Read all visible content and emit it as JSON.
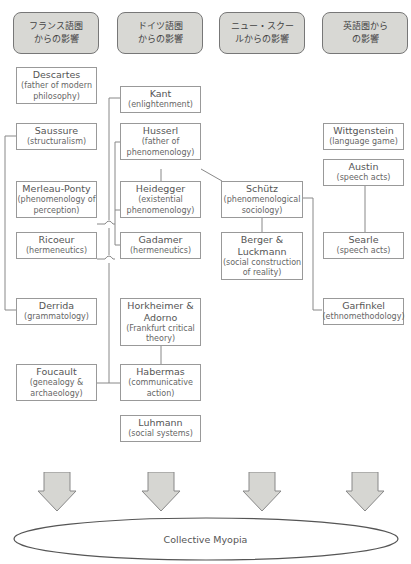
{
  "headers": [
    {
      "line1": "フランス語圏",
      "line2": "からの影響"
    },
    {
      "line1": "ドイツ語圏",
      "line2": "からの影響"
    },
    {
      "line1": "ニュー・スクー",
      "line2": "ルからの影響"
    },
    {
      "line1": "英語圏から",
      "line2": "の影響"
    }
  ],
  "nodes": {
    "descartes": {
      "name": "Descartes",
      "desc": "(father of modern philosophy)"
    },
    "saussure": {
      "name": "Saussure",
      "desc": "(structuralism)"
    },
    "merleau_ponty": {
      "name": "Merleau-Ponty",
      "desc": "(phenomenology of perception)"
    },
    "ricoeur": {
      "name": "Ricoeur",
      "desc": "(hermeneutics)"
    },
    "derrida": {
      "name": "Derrida",
      "desc": "(grammatology)"
    },
    "foucault": {
      "name": "Foucault",
      "desc": "(genealogy & archaeology)"
    },
    "kant": {
      "name": "Kant",
      "desc": "(enlightenment)"
    },
    "husserl": {
      "name": "Husserl",
      "desc": "(father of phenomenology)"
    },
    "heidegger": {
      "name": "Heidegger",
      "desc": "(existential phenomenology)"
    },
    "gadamer": {
      "name": "Gadamer",
      "desc": "(hermeneutics)"
    },
    "horkheimer": {
      "name": "Horkheimer & Adorno",
      "desc": "(Frankfurt critical theory)"
    },
    "habermas": {
      "name": "Habermas",
      "desc": "(communicative action)"
    },
    "luhmann": {
      "name": "Luhmann",
      "desc": "(social systems)"
    },
    "schutz": {
      "name": "Schütz",
      "desc": "(phenomenological sociology)"
    },
    "berger": {
      "name": "Berger & Luckmann",
      "desc": "(social construction of reality)"
    },
    "wittgenstein": {
      "name": "Wittgenstein",
      "desc": "(language game)"
    },
    "austin": {
      "name": "Austin",
      "desc": "(speech acts)"
    },
    "searle": {
      "name": "Searle",
      "desc": "(speech acts)"
    },
    "garfinkel": {
      "name": "Garfinkel",
      "desc": "(ethnomethodology)"
    }
  },
  "outcome": {
    "label": "Collective Myopia"
  },
  "colors": {
    "header_fill": "#d8d8d4",
    "arrow_fill": "#d6d6d2",
    "line": "#888888"
  }
}
